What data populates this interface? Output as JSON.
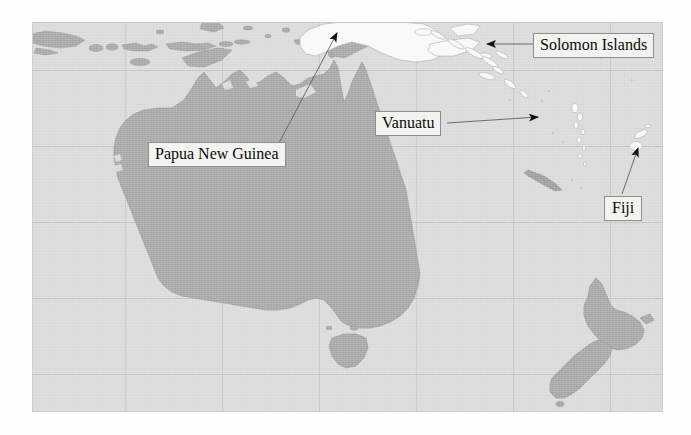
{
  "map": {
    "title": "Oceania reference map",
    "region": "Australia, New Zealand and the South Pacific",
    "colors": {
      "ocean": "#dcdcdc",
      "land": "#a9a9a9",
      "highlight_land": "#fbfbf8",
      "graticule": "#c6c6c6",
      "coastline": "#9a9a9a",
      "label_fill": "#f3f3f0",
      "label_border": "#8e8e8e",
      "leader_line": "#5a5a5a",
      "text": "#0a0a0a",
      "page": "#ffffff"
    },
    "graticule": {
      "visible": true,
      "vertical_x": [
        93,
        190,
        287,
        384,
        481,
        578
      ],
      "horizontal_y": [
        48,
        124,
        200,
        276,
        352
      ]
    },
    "frame": {
      "x": 32,
      "y": 22,
      "width": 631,
      "height": 390
    }
  },
  "labels": [
    {
      "id": "papua-new-guinea",
      "text": "Papua New Guinea",
      "highlighted": true,
      "leader": {
        "from_x": 280,
        "from_y": 145,
        "to_x": 333,
        "to_y": 32
      }
    },
    {
      "id": "solomon-islands",
      "text": "Solomon Islands",
      "highlighted": true,
      "leader": {
        "from_x": 533,
        "from_y": 44,
        "to_x": 485,
        "to_y": 44
      }
    },
    {
      "id": "vanuatu",
      "text": "Vanuatu",
      "highlighted": true,
      "leader": {
        "from_x": 448,
        "from_y": 122,
        "to_x": 536,
        "to_y": 116
      }
    },
    {
      "id": "fiji",
      "text": "Fiji",
      "highlighted": true,
      "leader": {
        "from_x": 622,
        "from_y": 194,
        "to_x": 637,
        "to_y": 145
      }
    }
  ],
  "landmasses": [
    {
      "name": "Australia",
      "labelled": false
    },
    {
      "name": "Tasmania",
      "labelled": false
    },
    {
      "name": "New Zealand North Island",
      "labelled": false
    },
    {
      "name": "New Zealand South Island",
      "labelled": false
    },
    {
      "name": "Papua New Guinea",
      "labelled": true
    },
    {
      "name": "Solomon Islands",
      "labelled": true
    },
    {
      "name": "Vanuatu",
      "labelled": true
    },
    {
      "name": "Fiji",
      "labelled": true
    },
    {
      "name": "New Caledonia",
      "labelled": false
    },
    {
      "name": "Java",
      "labelled": false
    },
    {
      "name": "Bali",
      "labelled": false
    },
    {
      "name": "Lombok",
      "labelled": false
    },
    {
      "name": "Sumbawa",
      "labelled": false
    },
    {
      "name": "Flores",
      "labelled": false
    },
    {
      "name": "Timor",
      "labelled": false
    },
    {
      "name": "Sulawesi",
      "labelled": false
    },
    {
      "name": "Seram",
      "labelled": false
    },
    {
      "name": "Halmahera",
      "labelled": false
    }
  ]
}
